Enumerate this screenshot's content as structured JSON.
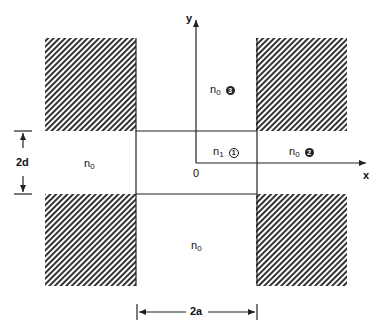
{
  "diagram": {
    "type": "rectangular waveguide cross-section",
    "axes": {
      "x_label": "x",
      "y_label": "y",
      "origin_label": "0"
    },
    "regions": [
      {
        "id": "core",
        "index_label": "n",
        "index_sub": "1",
        "marker": "1",
        "marker_style": "outline"
      },
      {
        "id": "right",
        "index_label": "n",
        "index_sub": "0",
        "marker": "2",
        "marker_style": "filled"
      },
      {
        "id": "top",
        "index_label": "n",
        "index_sub": "0",
        "marker": "3",
        "marker_style": "filled"
      },
      {
        "id": "left",
        "index_label": "n",
        "index_sub": "0"
      },
      {
        "id": "bottom",
        "index_label": "n",
        "index_sub": "0"
      }
    ],
    "dimensions": {
      "height_label": "2d",
      "width_label": "2a"
    },
    "colors": {
      "line": "#222222",
      "hatch": "#333333",
      "background": "#ffffff"
    }
  }
}
